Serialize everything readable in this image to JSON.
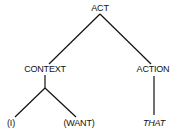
{
  "diagram": {
    "type": "tree",
    "nodes": {
      "root": {
        "label": "ACT"
      },
      "context": {
        "label": "CONTEXT"
      },
      "action": {
        "label": "ACTION"
      },
      "context_left": {
        "label": "(I)"
      },
      "context_right": {
        "label": "(WANT)"
      },
      "action_child": {
        "label": "THAT"
      }
    },
    "edges": [
      [
        "ACT",
        "CONTEXT"
      ],
      [
        "ACT",
        "ACTION"
      ],
      [
        "CONTEXT",
        "(I)"
      ],
      [
        "CONTEXT",
        "(WANT)"
      ],
      [
        "ACTION",
        "THAT"
      ]
    ],
    "colors": {
      "line": "#111111",
      "text": "#111111",
      "background": "#ffffff"
    }
  }
}
